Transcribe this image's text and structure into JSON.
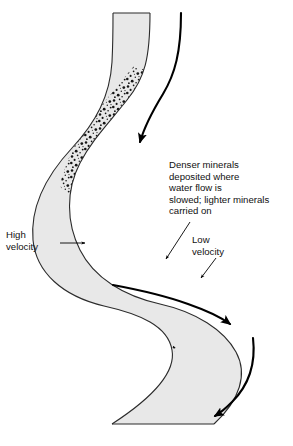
{
  "figure": {
    "background_color": "#ffffff",
    "channel_fill_color": "#e8e8e8",
    "channel_outline_color": "#2b2b2b",
    "flow_arrow_color": "#000000",
    "stipple_color": "#1a1a1a",
    "leader_color": "#000000"
  },
  "annotations": {
    "deposition_note": {
      "name": "deposition-note",
      "lines": [
        "Denser minerals",
        "deposited where",
        "water flow is",
        "slowed; lighter minerals",
        "carried on"
      ],
      "x": 169,
      "y": 168
    },
    "high_velocity": {
      "name": "high-velocity-label",
      "lines": [
        "High",
        "velocity"
      ],
      "x": 6,
      "y": 238
    },
    "low_velocity": {
      "name": "low-velocity-label",
      "lines": [
        "Low",
        "velocity"
      ],
      "x": 192,
      "y": 243
    }
  },
  "elements": {
    "channel_name": "river-channel",
    "thalweg_upper_name": "flow-arrow-upper",
    "thalweg_middle_name": "flow-arrow-middle",
    "thalweg_lower_name": "flow-arrow-lower",
    "stipple_upper_name": "sediment-deposit-upper",
    "stipple_middle_name": "sediment-deposit-middle",
    "stipple_lower_name": "sediment-deposit-lower",
    "leader_deposition_name": "leader-line-deposition",
    "leader_high_name": "leader-line-high-velocity",
    "leader_low_name": "leader-line-low-velocity"
  }
}
